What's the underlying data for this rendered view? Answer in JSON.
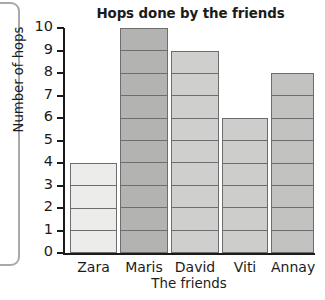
{
  "chart_data": {
    "type": "bar",
    "title": "Hops done by the friends",
    "xlabel": "The friends",
    "ylabel": "Number of hops",
    "categories": [
      "Zara",
      "Maris",
      "David",
      "Viti",
      "Annay"
    ],
    "values": [
      4,
      10,
      9,
      6,
      8
    ],
    "ylim": [
      0,
      10
    ],
    "ytick_labels": [
      "10",
      "9",
      "8",
      "7",
      "6",
      "5",
      "4",
      "3",
      "2",
      "1",
      "0"
    ],
    "yticks": [
      10,
      9,
      8,
      7,
      6,
      5,
      4,
      3,
      2,
      1,
      0
    ],
    "grid": false,
    "legend": false,
    "bar_segmented_by_unit": true,
    "bar_colors": [
      "#ececeb",
      "#b3b3b2",
      "#cfcfce",
      "#cdcdcc",
      "#c2c2c1"
    ],
    "bar_border_color": "#6d6d6d",
    "axis_color": "#1b1b1b",
    "background": "#ffffff"
  }
}
